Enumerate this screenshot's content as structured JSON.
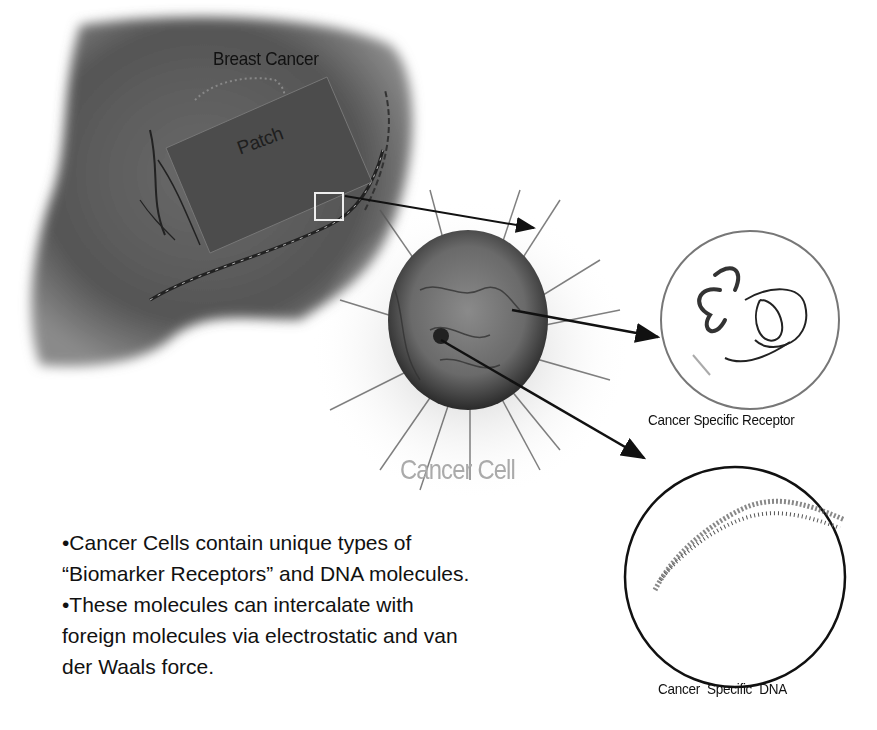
{
  "diagram": {
    "labels": {
      "breast_cancer": "Breast Cancer",
      "patch": "Patch",
      "cancer_cell": "Cancer Cell",
      "receptor": "Cancer Specific Receptor",
      "dna": "Cancer Specific DNA"
    },
    "bullets": [
      "•Cancer Cells contain unique types of",
      "“Biomarker Receptors” and DNA molecules.",
      "•These molecules can intercalate with",
      "foreign molecules via electrostatic and van",
      "der Waals force."
    ],
    "colors": {
      "tissue": "#5a5a5a",
      "patch": "#4a4a4a",
      "cell": "#6e6e6e",
      "arrow": "#111111"
    }
  }
}
